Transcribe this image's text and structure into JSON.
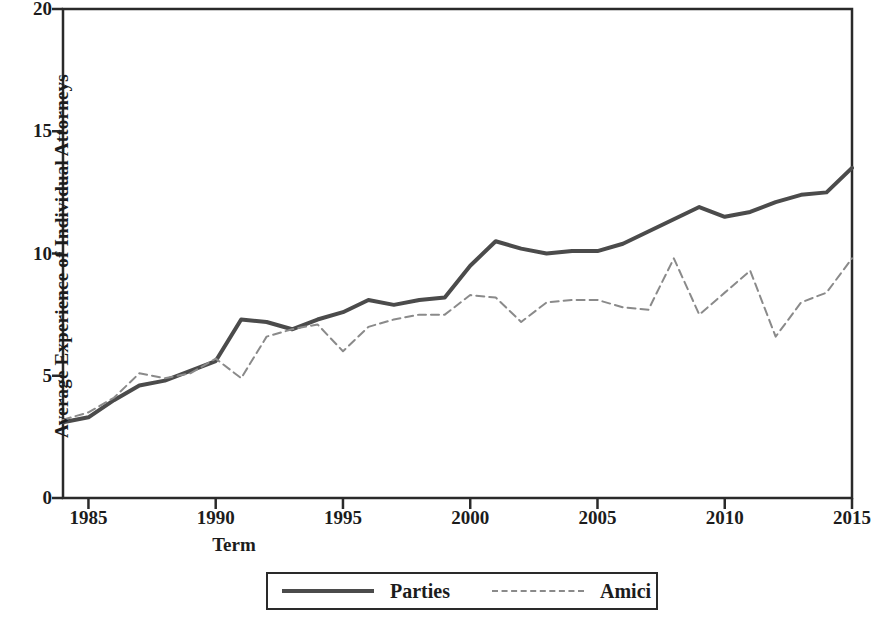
{
  "chart_data": {
    "type": "line",
    "title": "",
    "xlabel": "Term",
    "ylabel": "Average Experience of Individual Attorneys",
    "xlim": [
      1984,
      2015
    ],
    "ylim": [
      0,
      20
    ],
    "xticks": [
      1985,
      1990,
      1995,
      2000,
      2005,
      2010,
      2015
    ],
    "yticks": [
      0,
      5,
      10,
      15,
      20
    ],
    "grid": false,
    "legend_position": "below-center",
    "x": [
      1984,
      1985,
      1986,
      1987,
      1988,
      1989,
      1990,
      1991,
      1992,
      1993,
      1994,
      1995,
      1996,
      1997,
      1998,
      1999,
      2000,
      2001,
      2002,
      2003,
      2004,
      2005,
      2006,
      2007,
      2008,
      2009,
      2010,
      2011,
      2012,
      2013,
      2014,
      2015
    ],
    "series": [
      {
        "name": "Parties",
        "style": "solid",
        "color": "#4b4b4b",
        "values": [
          3.1,
          3.3,
          4.0,
          4.6,
          4.8,
          5.2,
          5.6,
          7.3,
          7.2,
          6.9,
          7.3,
          7.6,
          8.1,
          7.9,
          8.1,
          8.2,
          9.5,
          10.5,
          10.2,
          10.0,
          10.1,
          10.1,
          10.4,
          10.9,
          11.4,
          11.9,
          11.5,
          11.7,
          12.1,
          12.4,
          12.5,
          13.5
        ]
      },
      {
        "name": "Amici",
        "style": "dashed",
        "color": "#8a8a8a",
        "values": [
          3.2,
          3.5,
          4.1,
          5.1,
          4.9,
          5.1,
          5.7,
          4.9,
          6.6,
          6.9,
          7.1,
          6.0,
          7.0,
          7.3,
          7.5,
          7.5,
          8.3,
          8.2,
          7.2,
          8.0,
          8.1,
          8.1,
          7.8,
          7.7,
          9.8,
          7.5,
          8.4,
          9.3,
          6.6,
          8.0,
          8.4,
          9.8
        ]
      }
    ]
  },
  "legend": {
    "entries": [
      {
        "label": "Parties",
        "style": "solid"
      },
      {
        "label": "Amici",
        "style": "dashed"
      }
    ]
  },
  "axes": {
    "x_title": "Term",
    "y_title": "Average Experience of Individual Attorneys"
  }
}
